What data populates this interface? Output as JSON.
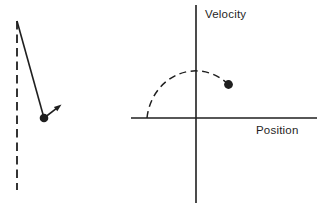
{
  "figure": {
    "phase_plot": {
      "ylabel": "Velocity",
      "xlabel": "Position"
    }
  },
  "icons": {
    "pendulum_bob": "filled-dot",
    "state_point": "filled-dot",
    "velocity_vector": "arrow-up-right"
  },
  "colors": {
    "ink": "#1f1f1f",
    "background": "#ffffff"
  }
}
